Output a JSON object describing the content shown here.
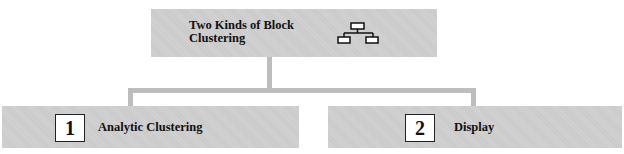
{
  "root": {
    "title": "Two Kinds of Block Clustering",
    "icon": "hierarchy-icon"
  },
  "children": [
    {
      "number": "1",
      "label": "Analytic Clustering"
    },
    {
      "number": "2",
      "label": "Display"
    }
  ],
  "colors": {
    "box_fill": "#c9c9c9",
    "connector": "#bdbdbd",
    "number_box_fill": "#ffffff",
    "text": "#111111"
  }
}
